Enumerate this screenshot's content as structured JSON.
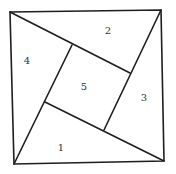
{
  "diagram": {
    "type": "square dissection (pinwheel)",
    "outer_square": {
      "top_left": [
        10,
        12
      ],
      "top_right": [
        161,
        10
      ],
      "bottom_right": [
        164,
        161
      ],
      "bottom_left": [
        14,
        164
      ]
    },
    "inner_square": {
      "top": [
        72,
        45
      ],
      "right": [
        130,
        73
      ],
      "bottom": [
        104,
        130
      ],
      "left": [
        45,
        102
      ]
    },
    "regions": [
      {
        "id": "1",
        "label": "1",
        "pos": [
          61,
          148
        ]
      },
      {
        "id": "2",
        "label": "2",
        "pos": [
          108,
          31
        ]
      },
      {
        "id": "3",
        "label": "3",
        "pos": [
          144,
          98
        ]
      },
      {
        "id": "4",
        "label": "4",
        "pos": [
          27,
          61
        ]
      },
      {
        "id": "5",
        "label": "5",
        "pos": [
          84,
          87
        ]
      }
    ],
    "line_color": "#1e1e1e"
  }
}
